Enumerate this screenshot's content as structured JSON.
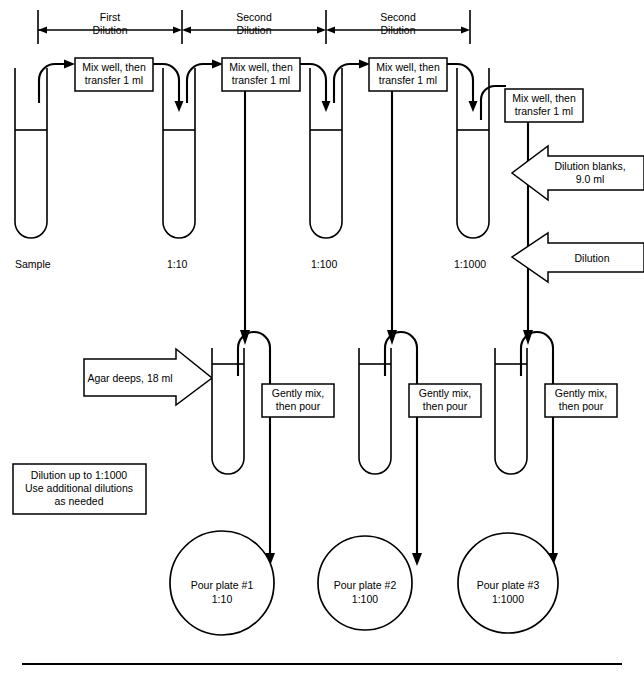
{
  "brackets": [
    {
      "label_line1": "First",
      "label_line2": "Dilution",
      "x_start": 38,
      "x_end": 182
    },
    {
      "label_line1": "Second",
      "label_line2": "Dilution",
      "x_start": 182,
      "x_end": 326
    },
    {
      "label_line1": "Second",
      "label_line2": "Dilution",
      "x_start": 326,
      "x_end": 470
    }
  ],
  "transfer_boxes": [
    {
      "line1": "Mix well, then",
      "line2": "transfer 1 ml"
    },
    {
      "line1": "Mix well, then",
      "line2": "transfer 1 ml"
    },
    {
      "line1": "Mix well, then",
      "line2": "transfer 1 ml"
    },
    {
      "line1": "Mix well, then",
      "line2": "transfer 1 ml"
    }
  ],
  "dilution_tubes": [
    {
      "label": "Sample"
    },
    {
      "label": "1:10"
    },
    {
      "label": "1:100"
    },
    {
      "label": "1:1000"
    }
  ],
  "side_arrows": [
    {
      "line1": "Dilution blanks,",
      "line2": "9.0 ml"
    },
    {
      "line1": "Dilution",
      "line2": ""
    }
  ],
  "agar_arrow": {
    "label": "Agar deeps, 18 ml"
  },
  "note_box": {
    "line1": "Dilution up to 1:1000",
    "line2": "Use additional dilutions",
    "line3": "as needed"
  },
  "pour_boxes": [
    {
      "line1": "Gently mix,",
      "line2": "then pour"
    },
    {
      "line1": "Gently mix,",
      "line2": "then pour"
    },
    {
      "line1": "Gently mix,",
      "line2": "then pour"
    }
  ],
  "plates": [
    {
      "line1": "Pour plate #1",
      "line2": "1:10"
    },
    {
      "line1": "Pour plate #2",
      "line2": "1:100"
    },
    {
      "line1": "Pour plate #3",
      "line2": "1:1000"
    }
  ],
  "colors": {
    "ink": "#000000",
    "paper": "#ffffff"
  }
}
